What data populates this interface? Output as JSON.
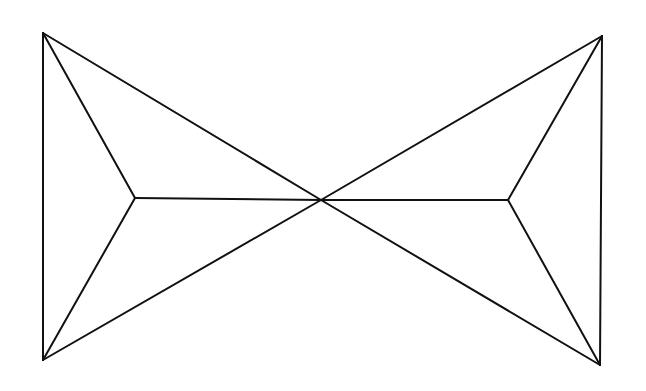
{
  "diagram": {
    "width": 646,
    "height": 391,
    "stroke": "#111111",
    "stroke_width": 2,
    "background": "#ffffff",
    "vertices": {
      "TL": [
        43,
        33
      ],
      "BL": [
        43,
        360
      ],
      "ML": [
        135,
        198
      ],
      "C": [
        321,
        200
      ],
      "MR": [
        508,
        200
      ],
      "TR": [
        602,
        36
      ],
      "BR": [
        600,
        365
      ]
    },
    "edges": [
      [
        "TL",
        "BL"
      ],
      [
        "TL",
        "ML"
      ],
      [
        "BL",
        "ML"
      ],
      [
        "ML",
        "C"
      ],
      [
        "TL",
        "C"
      ],
      [
        "BL",
        "C"
      ],
      [
        "C",
        "TR"
      ],
      [
        "C",
        "BR"
      ],
      [
        "C",
        "MR"
      ],
      [
        "TR",
        "MR"
      ],
      [
        "BR",
        "MR"
      ],
      [
        "TR",
        "BR"
      ]
    ]
  }
}
